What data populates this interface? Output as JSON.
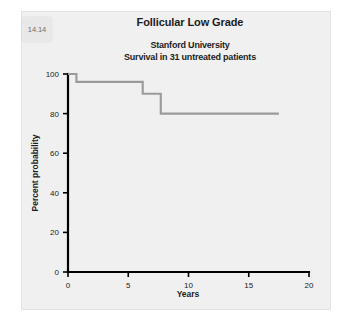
{
  "figure": {
    "tab_label": "14.14"
  },
  "titles": {
    "title": "Follicular Low Grade",
    "subtitle_line_1": "Stanford University",
    "subtitle_line_2": "Survival in 31 untreated patients"
  },
  "colors": {
    "panel_background": "#f0f0f0",
    "page_background": "#ffffff",
    "axis": "#000000",
    "curve": "#9a9a9a",
    "text": "#1d1d1d"
  },
  "chart_data": {
    "type": "line",
    "subtype": "kaplan-meier-step",
    "title": "Follicular Low Grade",
    "subtitle": "Stanford University / Survival in 31 untreated patients",
    "xlabel": "Years",
    "ylabel": "Percent probability",
    "xlim": [
      0,
      20
    ],
    "ylim": [
      0,
      100
    ],
    "xticks": [
      0,
      5,
      10,
      15,
      20
    ],
    "xtick_labels": [
      "0",
      "5",
      "10",
      "15",
      "20"
    ],
    "yticks": [
      0,
      20,
      40,
      60,
      80,
      100
    ],
    "ytick_labels": [
      "0",
      "20",
      "40",
      "60",
      "80",
      "100"
    ],
    "grid": false,
    "legend": false,
    "n_patients": 31,
    "series": [
      {
        "name": "Survival in 31 untreated patients",
        "color": "#9a9a9a",
        "x": [
          0,
          0.7,
          0.7,
          6.2,
          6.2,
          7.7,
          7.7,
          17.5
        ],
        "y": [
          100,
          100,
          96,
          96,
          90,
          90,
          80,
          80
        ],
        "steps": [
          {
            "time": 0.0,
            "percent": 100
          },
          {
            "time": 0.7,
            "percent": 96
          },
          {
            "time": 6.2,
            "percent": 90
          },
          {
            "time": 7.7,
            "percent": 80
          },
          {
            "time": 17.5,
            "percent": 80
          }
        ]
      }
    ]
  }
}
